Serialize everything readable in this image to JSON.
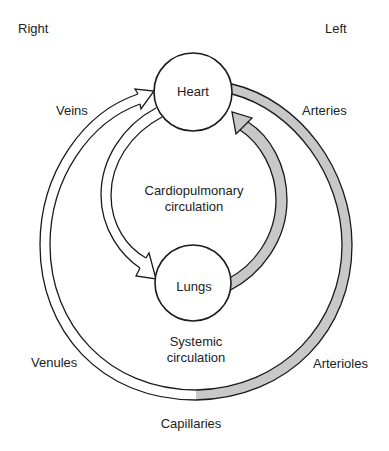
{
  "diagram": {
    "side_labels": {
      "right": "Right",
      "left": "Left"
    },
    "nodes": {
      "heart": "Heart",
      "lungs": "Lungs"
    },
    "circuits": {
      "cardiopulmonary_line1": "Cardiopulmonary",
      "cardiopulmonary_line2": "circulation",
      "systemic_line1": "Systemic",
      "systemic_line2": "circulation"
    },
    "vessels": {
      "veins": "Veins",
      "arteries": "Arteries",
      "venules": "Venules",
      "arterioles": "Arterioles",
      "capillaries": "Capillaries"
    },
    "colors": {
      "oxygenated_fill": "#c8c8c8",
      "deoxygenated_fill": "#ffffff",
      "stroke": "#1a1a1a"
    }
  }
}
